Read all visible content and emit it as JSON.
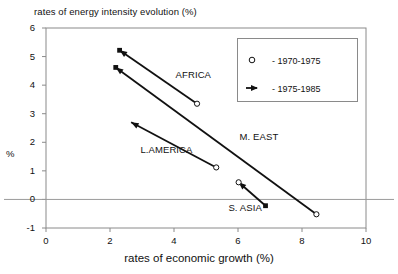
{
  "chart_data": {
    "type": "scatter",
    "title": "rates of energy intensity evolution (%)",
    "xlabel": "rates of economic growth (%)",
    "ylabel": "%",
    "xlim": [
      0,
      10
    ],
    "ylim": [
      -1,
      6
    ],
    "xticks": [
      0,
      2,
      4,
      6,
      8,
      10
    ],
    "yticks": [
      -1,
      0,
      1,
      2,
      3,
      4,
      5,
      6
    ],
    "xtick_labels": [
      "0",
      "2",
      "4",
      "6",
      "8",
      "10"
    ],
    "ytick_labels": [
      "-1",
      "0",
      "1",
      "2",
      "3",
      "4",
      "5",
      "6"
    ],
    "grid": false,
    "zero_line": true,
    "legend": {
      "position": "top-right",
      "entries": [
        {
          "marker": "open-circle",
          "label": "- 1970-1975"
        },
        {
          "marker": "arrow",
          "label": "- 1975-1985"
        }
      ]
    },
    "series": [
      {
        "name": "AFRICA",
        "label": "AFRICA",
        "label_xy": [
          4.05,
          4.35
        ],
        "points": [
          {
            "x": 2.3,
            "y": 5.22,
            "marker": "filled-square",
            "period": "1975-1985"
          },
          {
            "x": 4.72,
            "y": 3.35,
            "marker": "open-circle",
            "period": "1970-1975"
          }
        ],
        "arrow_from": [
          4.72,
          3.35
        ],
        "arrow_to": [
          2.3,
          5.22
        ]
      },
      {
        "name": "M. EAST",
        "label": "M. EAST",
        "label_xy": [
          6.05,
          2.2
        ],
        "points": [
          {
            "x": 2.18,
            "y": 4.62,
            "marker": "filled-square",
            "period": "1975-1985"
          },
          {
            "x": 8.45,
            "y": -0.52,
            "marker": "open-circle",
            "period": "1970-1975"
          }
        ],
        "arrow_from": [
          8.45,
          -0.52
        ],
        "arrow_to": [
          2.18,
          4.62
        ]
      },
      {
        "name": "L.AMERICA",
        "label": "L.AMERICA",
        "label_xy": [
          2.95,
          1.72
        ],
        "points": [
          {
            "x": 2.66,
            "y": 2.7,
            "marker": "arrow-head",
            "period": "1975-1985"
          },
          {
            "x": 5.32,
            "y": 1.12,
            "marker": "open-circle",
            "period": "1970-1975"
          }
        ],
        "arrow_from": [
          5.32,
          1.12
        ],
        "arrow_to": [
          2.66,
          2.7
        ]
      },
      {
        "name": "S. ASIA",
        "label": "S. ASIA",
        "label_xy": [
          5.7,
          -0.3
        ],
        "points": [
          {
            "x": 6.02,
            "y": 0.6,
            "marker": "open-circle",
            "period": "1970-1975"
          },
          {
            "x": 6.86,
            "y": -0.22,
            "marker": "filled-square",
            "period": "1975-1985"
          }
        ],
        "arrow_from": [
          6.86,
          -0.22
        ],
        "arrow_to": [
          6.02,
          0.6
        ]
      }
    ]
  },
  "colors": {
    "ink": "#111111",
    "frame": "#8a8a8a",
    "background": "#ffffff"
  }
}
